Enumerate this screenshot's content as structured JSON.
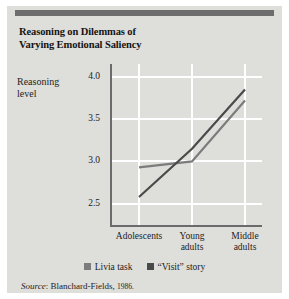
{
  "figure": {
    "title_line1": "Reasoning on Dilemmas of",
    "title_line2": "Varying Emotional Saliency",
    "panel_color": "#dededb",
    "header_bar_color": "#6d6d6d"
  },
  "source": {
    "label": "Source",
    "separator": ": ",
    "citation": "Blanchard-Fields, ",
    "year": "1986."
  },
  "axes": {
    "ylabel_line1": "Reasoning",
    "ylabel_line2": "level"
  },
  "chart_data": {
    "type": "line",
    "title": "Reasoning on Dilemmas of Varying Emotional Saliency",
    "xlabel": "",
    "ylabel": "Reasoning level",
    "categories": [
      "Adolescents",
      "Young adults",
      "Middle adults"
    ],
    "category_labels": [
      {
        "line1": "Adolescents",
        "line2": ""
      },
      {
        "line1": "Young",
        "line2": "adults"
      },
      {
        "line1": "Middle",
        "line2": "adults"
      }
    ],
    "ylim": [
      2.25,
      4.15
    ],
    "yticks": [
      2.5,
      3.0,
      3.5,
      4.0
    ],
    "ytick_labels": [
      "2.5",
      "3.0",
      "3.5",
      "4.0"
    ],
    "grid": true,
    "grid_color": "#ffffff",
    "legend_position": "bottom",
    "series": [
      {
        "name": "Livia task",
        "color": "#7c7c7c",
        "values": [
          2.93,
          3.0,
          3.72
        ]
      },
      {
        "name": "“Visit” story",
        "color": "#4a4a4a",
        "values": [
          2.58,
          3.15,
          3.85
        ]
      }
    ]
  }
}
